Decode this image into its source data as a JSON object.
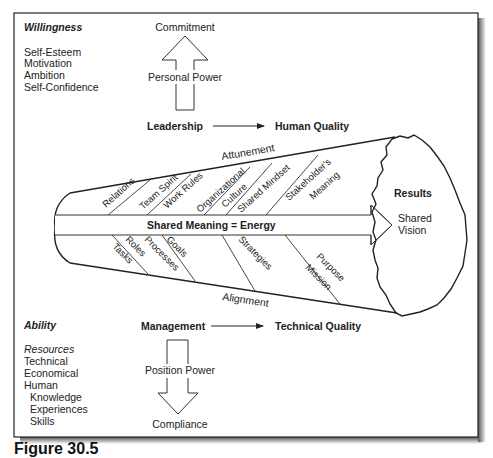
{
  "willingness": {
    "heading": "Willingness",
    "items": [
      "Self-Esteem",
      "Motivation",
      "Ambition",
      "Self-Confidence"
    ]
  },
  "top_arrow": {
    "label": "Personal Power",
    "target": "Commitment"
  },
  "leadership_row": {
    "source": "Leadership",
    "target": "Human Quality"
  },
  "funnel": {
    "top_edge_label": "Attunement",
    "bottom_edge_label": "Alignment",
    "center_label": "Shared Meaning = Energy",
    "upper_factors": [
      "Relations",
      "Team Spirit",
      "Work Rules",
      "Organizational",
      "Culture",
      "Shared Mindset",
      "Stakeholder's",
      "Meaning"
    ],
    "lower_factors": [
      "Tasks",
      "Roles",
      "Processes",
      "Goals",
      "Strategies",
      "Purpose",
      "Mission"
    ]
  },
  "results": {
    "heading": "Results",
    "line1": "Shared",
    "line2": "Vision"
  },
  "management_row": {
    "source": "Management",
    "target": "Technical Quality"
  },
  "ability": {
    "heading": "Ability",
    "subheading": "Resources",
    "items": [
      "Technical",
      "Economical",
      "Human"
    ],
    "sub_items": [
      "Knowledge",
      "Experiences",
      "Skills"
    ]
  },
  "bottom_arrow": {
    "label": "Position Power",
    "target": "Compliance"
  },
  "caption": "Figure 30.5"
}
